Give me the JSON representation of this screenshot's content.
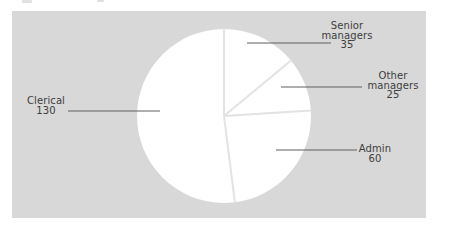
{
  "chart_data": {
    "type": "pie",
    "title": "",
    "labels": [
      "Senior managers",
      "Other managers",
      "Admin",
      "Clerical"
    ],
    "values": [
      35,
      25,
      60,
      130
    ],
    "total": 250,
    "start_angle_deg": 0,
    "direction": "clockwise",
    "legend_position": "none",
    "callouts": [
      {
        "label": "Senior managers",
        "value": 35,
        "display": "Senior\nmanagers\n35"
      },
      {
        "label": "Other managers",
        "value": 25,
        "display": "Other\nmanagers\n25"
      },
      {
        "label": "Admin",
        "value": 60,
        "display": "Admin\n60"
      },
      {
        "label": "Clerical",
        "value": 130,
        "display": "Clerical\n130"
      }
    ],
    "colors": {
      "panel_background": "#d8d8d8",
      "slice_fill": "#ffffff",
      "divider_line": "#e3e3e3",
      "leader_line": "#5f5f5f",
      "label_text": "#3d3d3d"
    }
  }
}
